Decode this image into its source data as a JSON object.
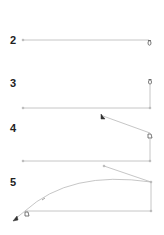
{
  "steps": [
    {
      "number": "2",
      "label_pos": [
        10,
        35
      ]
    },
    {
      "number": "3",
      "label_pos": [
        10,
        78
      ]
    },
    {
      "number": "4",
      "label_pos": [
        10,
        123
      ]
    },
    {
      "number": "5",
      "label_pos": [
        10,
        177
      ]
    }
  ],
  "colors": {
    "line": "#b8b8b8",
    "marker": "#333333",
    "label": "#222222",
    "background": "#ffffff"
  },
  "icons": {
    "anchor": "anchor-icon",
    "arrow": "arrow-marker-icon"
  }
}
